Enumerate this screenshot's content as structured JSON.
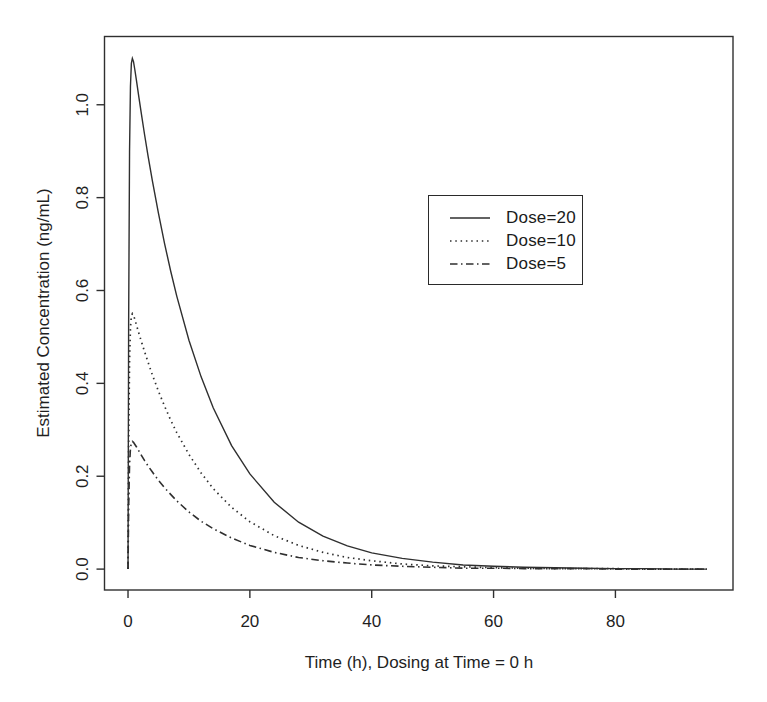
{
  "figure": {
    "background": "#ffffff",
    "ink_color": "#2f2f2f",
    "text_color": "#1f1f1f"
  },
  "chart_data": {
    "type": "line",
    "title": "",
    "xlabel": "Time (h), Dosing at Time = 0 h",
    "ylabel": "Estimated Concentration (ng/mL)",
    "xlim": [
      -3.86,
      99.3
    ],
    "ylim": [
      -0.045,
      1.147
    ],
    "xticks": [
      0,
      20,
      40,
      60,
      80
    ],
    "xtick_labels": [
      "0",
      "20",
      "40",
      "60",
      "80"
    ],
    "yticks": [
      0.0,
      0.2,
      0.4,
      0.6,
      0.8,
      1.0
    ],
    "ytick_labels": [
      "0.0",
      "0.2",
      "0.4",
      "0.6",
      "0.8",
      "1.0"
    ],
    "grid": false,
    "legend_position": "inside-top-right",
    "x": [
      0,
      0.1,
      0.25,
      0.4,
      0.55,
      0.714,
      0.9,
      1.1,
      1.4,
      1.8,
      2.2,
      2.7,
      3.3,
      4,
      5,
      6,
      7,
      8,
      10,
      12,
      14,
      17,
      20,
      24,
      28,
      32,
      36,
      40,
      45,
      50,
      55,
      60,
      65,
      70,
      75,
      80,
      85,
      90,
      95
    ],
    "series": [
      {
        "name": "Dose=20",
        "linestyle": "solid",
        "peak": 1.1,
        "values": [
          0,
          0.526,
          0.898,
          1.04,
          1.089,
          1.1,
          1.093,
          1.077,
          1.051,
          1.015,
          0.98,
          0.937,
          0.889,
          0.836,
          0.766,
          0.701,
          0.642,
          0.588,
          0.493,
          0.414,
          0.347,
          0.266,
          0.205,
          0.144,
          0.101,
          0.071,
          0.05,
          0.035,
          0.023,
          0.015,
          0.009,
          0.006,
          0.004,
          0.003,
          0.002,
          0.001,
          0.001,
          0.0,
          0.0
        ]
      },
      {
        "name": "Dose=10",
        "linestyle": "dotted",
        "peak": 0.55,
        "values": [
          0,
          0.263,
          0.449,
          0.52,
          0.545,
          0.55,
          0.546,
          0.539,
          0.525,
          0.507,
          0.49,
          0.469,
          0.445,
          0.418,
          0.383,
          0.351,
          0.321,
          0.294,
          0.247,
          0.207,
          0.173,
          0.133,
          0.102,
          0.072,
          0.051,
          0.036,
          0.025,
          0.018,
          0.011,
          0.007,
          0.005,
          0.003,
          0.002,
          0.001,
          0.001,
          0.001,
          0.0,
          0.0,
          0.0
        ]
      },
      {
        "name": "Dose=5",
        "linestyle": "dashdot",
        "peak": 0.275,
        "values": [
          0,
          0.131,
          0.224,
          0.26,
          0.272,
          0.275,
          0.273,
          0.269,
          0.263,
          0.254,
          0.245,
          0.234,
          0.222,
          0.209,
          0.191,
          0.175,
          0.161,
          0.147,
          0.123,
          0.103,
          0.087,
          0.067,
          0.051,
          0.036,
          0.025,
          0.018,
          0.013,
          0.009,
          0.006,
          0.004,
          0.002,
          0.002,
          0.001,
          0.001,
          0.001,
          0.0,
          0.0,
          0.0,
          0.0
        ]
      }
    ]
  }
}
